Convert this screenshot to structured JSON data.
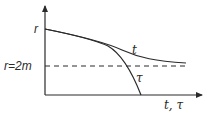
{
  "diagram": {
    "type": "schwarzschild-infall-plot",
    "axes": {
      "y_label": "r",
      "x_label": "t, τ"
    },
    "reference_line": {
      "label": "r=2m",
      "style": "dashed"
    },
    "curves": [
      {
        "name": "t",
        "label": "t",
        "behavior": "asymptotically approaches r=2m"
      },
      {
        "name": "tau",
        "label": "τ",
        "behavior": "crosses r=2m and reaches r=0 in finite time"
      }
    ],
    "colors": {
      "line": "#2a2a2a",
      "background": "#ffffff"
    }
  }
}
